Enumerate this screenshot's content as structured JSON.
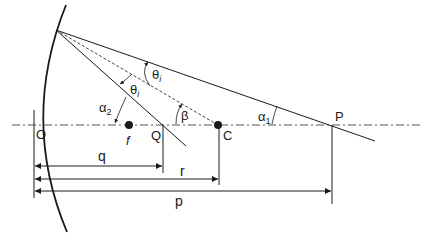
{
  "diagram": {
    "type": "concave-mirror-ray-geometry",
    "points": {
      "O": "O",
      "f": "f",
      "Q": "Q",
      "C": "C",
      "P": "P"
    },
    "angles": {
      "theta_i_upper": "θ",
      "theta_i_upper_sub": "i",
      "theta_i_lower": "θ",
      "theta_i_lower_sub": "i",
      "alpha1": "α",
      "alpha1_sub": "1",
      "alpha2": "α",
      "alpha2_sub": "2",
      "beta": "β"
    },
    "distances": {
      "q": "q",
      "r": "r",
      "p": "p"
    },
    "colors": {
      "ink": "#1a1a1a",
      "axis": "#555555",
      "dashed_normal": "#444444"
    }
  }
}
